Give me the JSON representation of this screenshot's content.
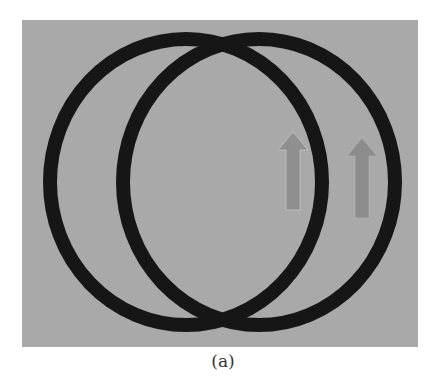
{
  "figure": {
    "caption": "(a)",
    "background_color": "#a9a9a9",
    "ring_color": "#161616",
    "arrow_color": "#8f8f8f",
    "rings": [
      {
        "name": "left-ring",
        "cx": 186,
        "cy": 182,
        "rx": 136,
        "ry": 143,
        "stroke_width": 14
      },
      {
        "name": "right-ring",
        "cx": 259,
        "cy": 182,
        "rx": 136,
        "ry": 143,
        "stroke_width": 14
      }
    ],
    "arrows": [
      {
        "name": "inner-arrow",
        "direction": "up",
        "x": 293,
        "y_top": 132,
        "y_bottom": 210
      },
      {
        "name": "outer-arrow",
        "direction": "up",
        "x": 362,
        "y_top": 138,
        "y_bottom": 218
      }
    ]
  }
}
